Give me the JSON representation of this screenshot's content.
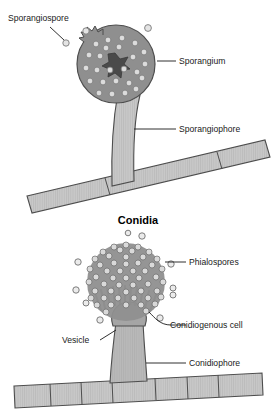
{
  "figure": {
    "title_heading": "Conidia",
    "background_color": "#ffffff",
    "body_fill": "#8f8f8f",
    "hypha_fill": "#c8c8c8",
    "spore_fill": "#d8d8d8",
    "outline_color": "#4d4d4d",
    "text_color": "#1a1a1a"
  },
  "panels": [
    {
      "id": "sporangium-panel",
      "name": "Sporangium / sporangiophore structure",
      "labels": [
        {
          "id": "sporangiospore",
          "text": "Sporangiospore",
          "side": "left"
        },
        {
          "id": "sporangium",
          "text": "Sporangium",
          "side": "right"
        },
        {
          "id": "sporangiophore",
          "text": "Sporangiophore",
          "side": "right"
        }
      ]
    },
    {
      "id": "conidia-panel",
      "name": "Conidial head structure",
      "heading": "Conidia",
      "labels": [
        {
          "id": "phialospores",
          "text": "Phialospores",
          "side": "right"
        },
        {
          "id": "conidiogenous-cell",
          "text": "Conidiogenous cell",
          "side": "right"
        },
        {
          "id": "vesicle",
          "text": "Vesicle",
          "side": "left"
        },
        {
          "id": "conidiophore",
          "text": "Conidiophore",
          "side": "right"
        }
      ]
    }
  ]
}
